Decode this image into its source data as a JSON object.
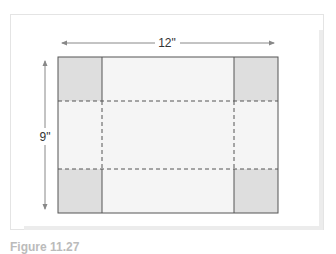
{
  "figure": {
    "width_label": "12\"",
    "height_label": "9\"",
    "caption": "Figure 11.27",
    "colors": {
      "corner_fill": "#dedede",
      "panel_fill": "#f5f5f5",
      "line": "#555555",
      "arrow": "#888888"
    }
  }
}
